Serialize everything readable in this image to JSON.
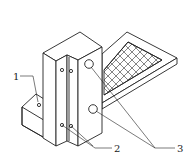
{
  "figure": {
    "type": "isometric technical drawing",
    "stroke_color": "#222222",
    "background": "#ffffff",
    "labels": [
      {
        "id": "1",
        "text": "1",
        "x": 13,
        "y": 72
      },
      {
        "id": "2",
        "text": "2",
        "x": 114,
        "y": 145
      },
      {
        "id": "3",
        "text": "3",
        "x": 177,
        "y": 145
      }
    ]
  }
}
